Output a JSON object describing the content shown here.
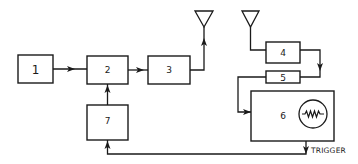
{
  "diagram": {
    "type": "block-diagram",
    "blocks": [
      {
        "id": "1",
        "label": "1"
      },
      {
        "id": "2",
        "label": "2"
      },
      {
        "id": "3",
        "label": "3"
      },
      {
        "id": "4",
        "label": "4"
      },
      {
        "id": "5",
        "label": "5"
      },
      {
        "id": "6",
        "label": "6"
      },
      {
        "id": "7",
        "label": "7"
      }
    ],
    "antennas": [
      "transmit-antenna",
      "receive-antenna"
    ],
    "display_icon": "waveform-circle-icon",
    "trigger_label": "TRIGGER",
    "connections": [
      {
        "from": "1",
        "to": "2"
      },
      {
        "from": "2",
        "to": "3"
      },
      {
        "from": "3",
        "to": "transmit-antenna"
      },
      {
        "from": "7",
        "to": "2"
      },
      {
        "from": "receive-antenna",
        "to": "4"
      },
      {
        "from": "4",
        "to": "5"
      },
      {
        "from": "5",
        "to": "6"
      },
      {
        "from": "6",
        "to": "7",
        "label": "TRIGGER"
      }
    ]
  }
}
